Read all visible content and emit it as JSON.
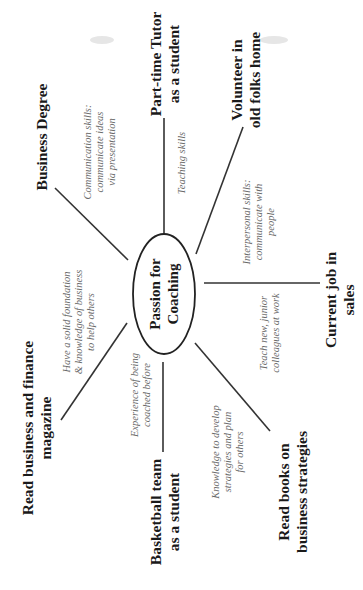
{
  "diagram": {
    "type": "mind-map",
    "orientation": "rotated -90 degrees (text reads bottom-to-top)",
    "center": {
      "lines": [
        "Passion for",
        "Coaching"
      ]
    },
    "branches": [
      {
        "id": "business-degree",
        "label_lines": [
          "Business Degree"
        ],
        "note_lines": [
          "Communication skills:",
          "communicate ideas",
          "via presentation"
        ]
      },
      {
        "id": "part-time-tutor",
        "label_lines": [
          "Part-time Tutor",
          "as a student"
        ],
        "note_lines": [
          "Teaching skills"
        ]
      },
      {
        "id": "volunteer",
        "label_lines": [
          "Volunteer in",
          "old folks home"
        ],
        "note_lines": [
          "Interpersonal skills:",
          "communicate with",
          "people"
        ]
      },
      {
        "id": "current-job",
        "label_lines": [
          "Current job in",
          "sales"
        ],
        "note_lines": [
          "Teach new, junior",
          "colleagues at work"
        ]
      },
      {
        "id": "read-books",
        "label_lines": [
          "Read books on",
          "business strategies"
        ],
        "note_lines": [
          "Knowledge to develop",
          "strategies and plan",
          "for others"
        ]
      },
      {
        "id": "basketball-team",
        "label_lines": [
          "Basketball team",
          "as a student"
        ],
        "note_lines": [
          "Experience of being",
          "coached before"
        ]
      },
      {
        "id": "read-magazine",
        "label_lines": [
          "Read business and finance",
          "magazine"
        ],
        "note_lines": [
          "Have a solid foundation",
          "& knowledge of business",
          "to help others"
        ]
      }
    ]
  }
}
